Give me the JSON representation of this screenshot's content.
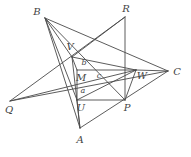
{
  "figure": {
    "kind": "geometry-diagram",
    "title": "",
    "caption": "",
    "background_color": "#ffffff",
    "stroke_color": "#4a4a4a",
    "label_color": "#444444",
    "width": 191,
    "height": 157,
    "vertex_labels": [
      {
        "id": "B",
        "text": "B",
        "x": 37,
        "y": 12,
        "size": "big"
      },
      {
        "id": "R",
        "text": "R",
        "x": 126,
        "y": 9,
        "size": "big"
      },
      {
        "id": "V",
        "text": "V",
        "x": 70,
        "y": 47,
        "size": "big"
      },
      {
        "id": "b",
        "text": "b",
        "x": 84,
        "y": 63,
        "size": "small"
      },
      {
        "id": "M",
        "text": "M",
        "x": 81,
        "y": 78,
        "size": "big"
      },
      {
        "id": "c",
        "text": "c",
        "x": 99,
        "y": 76,
        "size": "small"
      },
      {
        "id": "W",
        "text": "W",
        "x": 142,
        "y": 76,
        "size": "big"
      },
      {
        "id": "C",
        "text": "C",
        "x": 177,
        "y": 72,
        "size": "big"
      },
      {
        "id": "a",
        "text": "a",
        "x": 83,
        "y": 91,
        "size": "small"
      },
      {
        "id": "Q",
        "text": "Q",
        "x": 9,
        "y": 110,
        "size": "big"
      },
      {
        "id": "U",
        "text": "U",
        "x": 81,
        "y": 108,
        "size": "big"
      },
      {
        "id": "P",
        "text": "P",
        "x": 127,
        "y": 108,
        "size": "big"
      },
      {
        "id": "A",
        "text": "A",
        "x": 80,
        "y": 140,
        "size": "big"
      }
    ],
    "points": {
      "B": [
        45,
        18
      ],
      "R": [
        125,
        17
      ],
      "V": [
        72,
        57
      ],
      "M": [
        77,
        70
      ],
      "W": [
        136,
        70
      ],
      "C": [
        168,
        71
      ],
      "U": [
        77,
        100
      ],
      "P": [
        125,
        100
      ],
      "Q": [
        10,
        101
      ],
      "A": [
        80,
        128
      ]
    },
    "segments": [
      {
        "name": "B-C",
        "from": "B",
        "to": "C"
      },
      {
        "name": "B-A",
        "from": "B",
        "to": "A"
      },
      {
        "name": "B-V",
        "from": "B",
        "to": "V"
      },
      {
        "name": "B-U",
        "from": "B",
        "to": "U"
      },
      {
        "name": "B-P",
        "from": "B",
        "to": "P"
      },
      {
        "name": "R-Q",
        "from": "R",
        "to": "Q"
      },
      {
        "name": "R-P",
        "from": "R",
        "to": "P"
      },
      {
        "name": "R-V",
        "from": "R",
        "to": "V"
      },
      {
        "name": "A-C",
        "from": "A",
        "to": "C"
      },
      {
        "name": "A-V",
        "from": "A",
        "to": "V"
      },
      {
        "name": "A-U",
        "from": "A",
        "to": "U"
      },
      {
        "name": "Q-C",
        "from": "Q",
        "to": "C"
      },
      {
        "name": "Q-W",
        "from": "Q",
        "to": "W"
      },
      {
        "name": "V-M",
        "from": "V",
        "to": "M"
      },
      {
        "name": "V-W",
        "from": "V",
        "to": "W"
      },
      {
        "name": "M-W",
        "from": "M",
        "to": "W"
      },
      {
        "name": "M-U",
        "from": "M",
        "to": "U"
      },
      {
        "name": "U-W",
        "from": "U",
        "to": "W"
      },
      {
        "name": "U-P",
        "from": "U",
        "to": "P"
      },
      {
        "name": "W-P",
        "from": "W",
        "to": "P"
      },
      {
        "name": "W-C",
        "from": "W",
        "to": "C"
      }
    ]
  }
}
